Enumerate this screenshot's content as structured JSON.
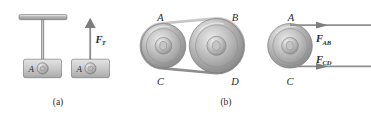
{
  "figure": {
    "background_color": "#ffffff",
    "ink_color": "#2b2b2b",
    "metal_light": "#e8e8e8",
    "metal_mid": "#b9b9b9",
    "metal_dark": "#8a8a8a",
    "panels": [
      {
        "id": "panel-a",
        "caption": "(a)",
        "subfigures": [
          {
            "id": "hanging-block",
            "block_label": "A",
            "description": "block A suspended by a cord from a ceiling support"
          },
          {
            "id": "free-body-block",
            "block_label": "A",
            "force_label": "F",
            "force_subscript": "T",
            "description": "free body diagram of block A with upward tension force"
          }
        ]
      },
      {
        "id": "panel-b",
        "caption": "(b)",
        "subfigures": [
          {
            "id": "belt-drive",
            "description": "belt wrapped around two pulleys",
            "point_labels": [
              "A",
              "B",
              "C",
              "D"
            ]
          },
          {
            "id": "pulley-free-body",
            "description": "free body diagram of left pulley with two belt forces",
            "point_labels": [
              "A",
              "C"
            ],
            "forces": [
              {
                "label": "F",
                "subscript": "AB"
              },
              {
                "label": "F",
                "subscript": "CD"
              }
            ]
          }
        ]
      }
    ]
  },
  "panel_a": {
    "caption": "(a)",
    "hanging": {
      "block_label": "A"
    },
    "freebody": {
      "block_label": "A",
      "force": {
        "label": "F",
        "subscript": "T"
      }
    }
  },
  "panel_b": {
    "caption": "(b)",
    "belt": {
      "label_a": "A",
      "label_b": "B",
      "label_c": "C",
      "label_d": "D"
    },
    "freebody": {
      "label_a": "A",
      "label_c": "C",
      "force_ab": {
        "label": "F",
        "subscript": "AB"
      },
      "force_cd": {
        "label": "F",
        "subscript": "CD"
      }
    }
  }
}
